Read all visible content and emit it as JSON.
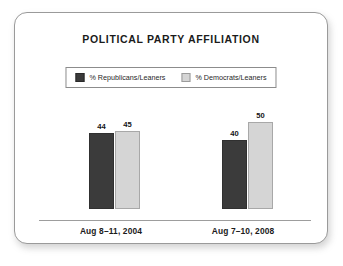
{
  "card": {
    "title": "POLITICAL PARTY AFFILIATION"
  },
  "chart_data": {
    "type": "bar",
    "title": "POLITICAL PARTY AFFILIATION",
    "xlabel": "",
    "ylabel": "",
    "ylim": [
      0,
      60
    ],
    "grid": false,
    "legend_position": "top-center",
    "categories": [
      "Aug 8–11, 2004",
      "Aug 7–10, 2008"
    ],
    "series": [
      {
        "name": "% Republicans/Leaners",
        "color": "#3b3b3b",
        "values": [
          44,
          40
        ]
      },
      {
        "name": "% Democrats/Leaners",
        "color": "#d5d5d5",
        "values": [
          45,
          50
        ]
      }
    ]
  }
}
